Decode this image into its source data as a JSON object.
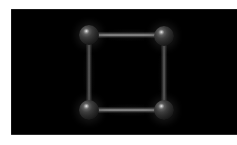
{
  "scene": {
    "title": "Square molecular wireframe render",
    "background_color": "#000000",
    "page_background_color": "#ffffff",
    "canvas": {
      "label": "3D render viewport",
      "x": 11,
      "y": 9,
      "width": 226,
      "height": 126
    },
    "atoms": [
      {
        "id": "atom-top-left",
        "label": "",
        "x": 89,
        "y": 35,
        "radius": 10,
        "color": "#3d3d3d",
        "highlight_color": "#c9c9c9"
      },
      {
        "id": "atom-top-right",
        "label": "",
        "x": 164,
        "y": 36,
        "radius": 10,
        "color": "#3d3d3d",
        "highlight_color": "#c9c9c9"
      },
      {
        "id": "atom-bottom-left",
        "label": "",
        "x": 89,
        "y": 110,
        "radius": 10,
        "color": "#3d3d3d",
        "highlight_color": "#c9c9c9"
      },
      {
        "id": "atom-bottom-right",
        "label": "",
        "x": 164,
        "y": 110,
        "radius": 10,
        "color": "#3d3d3d",
        "highlight_color": "#c9c9c9"
      }
    ],
    "bonds": [
      {
        "id": "bond-top",
        "label": "",
        "orientation": "horizontal",
        "from": "atom-top-left",
        "to": "atom-top-right",
        "x": 95,
        "y": 32,
        "length": 70,
        "thickness": 6,
        "color": "#b9b9b9"
      },
      {
        "id": "bond-bottom",
        "label": "",
        "orientation": "horizontal",
        "from": "atom-bottom-left",
        "to": "atom-bottom-right",
        "x": 95,
        "y": 107,
        "length": 70,
        "thickness": 6,
        "color": "#b9b9b9"
      },
      {
        "id": "bond-left",
        "label": "",
        "orientation": "vertical",
        "from": "atom-top-left",
        "to": "atom-bottom-left",
        "x": 86,
        "y": 42,
        "length": 66,
        "thickness": 6,
        "color": "#767676"
      },
      {
        "id": "bond-right",
        "label": "",
        "orientation": "vertical",
        "from": "atom-top-right",
        "to": "atom-bottom-right",
        "x": 161,
        "y": 42,
        "length": 66,
        "thickness": 6,
        "color": "#767676"
      }
    ]
  },
  "chart_data": {
    "type": "scatter",
    "xlabel": "",
    "ylabel": "",
    "xlim": [
      0,
      226
    ],
    "ylim": [
      0,
      126
    ],
    "grid": false,
    "legend": "none",
    "nodes": [
      {
        "name": "top-left",
        "x": 78,
        "y": 26
      },
      {
        "name": "top-right",
        "x": 153,
        "y": 27
      },
      {
        "name": "bottom-left",
        "x": 78,
        "y": 101
      },
      {
        "name": "bottom-right",
        "x": 153,
        "y": 101
      }
    ],
    "edges": [
      [
        "top-left",
        "top-right"
      ],
      [
        "top-right",
        "bottom-right"
      ],
      [
        "bottom-right",
        "bottom-left"
      ],
      [
        "bottom-left",
        "top-left"
      ]
    ]
  }
}
